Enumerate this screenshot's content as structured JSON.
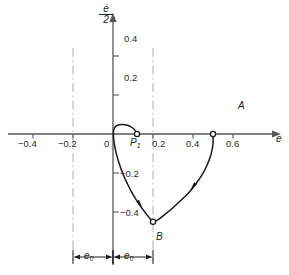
{
  "chart_data": {
    "type": "line",
    "title": "",
    "xlabel": "e",
    "ylabel": "ė/2",
    "ylabel_numerator": "ė",
    "ylabel_denominator": "2",
    "grid": false,
    "legend_position": "none",
    "xlim": [
      -0.52,
      0.72
    ],
    "ylim": [
      -0.55,
      0.52
    ],
    "xticks": [
      -0.4,
      -0.2,
      0,
      0.2,
      0.4,
      0.6
    ],
    "xtick_labels": [
      "−0.4",
      "−0.2",
      "0",
      "0.2",
      "0.4",
      "0.6"
    ],
    "yticks": [
      0.2,
      0.4,
      -0.2,
      -0.4
    ],
    "ytick_labels": [
      "0.2",
      "0.4",
      "−0.2",
      "−0.4"
    ],
    "reference_lines": [
      {
        "name": "switching-line-left",
        "x": -0.2,
        "style": "dash-dot"
      },
      {
        "name": "switching-line-right",
        "x": 0.2,
        "style": "dash-dot"
      }
    ],
    "points": [
      {
        "id": "A",
        "label": "A",
        "x": 0.5,
        "y": 0.0,
        "marker": "open-circle"
      },
      {
        "id": "B",
        "label": "B",
        "x": 0.2,
        "y": -0.45,
        "marker": "open-circle"
      },
      {
        "id": "P1",
        "label": "P",
        "label_sub": "1",
        "x": 0.12,
        "y": 0.0,
        "marker": "open-circle"
      }
    ],
    "series": [
      {
        "name": "trajectory-A-to-B",
        "direction": "A to B",
        "x": [
          0.5,
          0.5,
          0.49,
          0.47,
          0.445,
          0.415,
          0.38,
          0.34,
          0.3,
          0.26,
          0.228,
          0.206,
          0.2
        ],
        "y": [
          0.0,
          -0.05,
          -0.105,
          -0.16,
          -0.21,
          -0.255,
          -0.3,
          -0.34,
          -0.378,
          -0.412,
          -0.438,
          -0.45,
          -0.452
        ]
      },
      {
        "name": "trajectory-B-to-P1",
        "direction": "B to P1",
        "x": [
          0.2,
          0.178,
          0.155,
          0.132,
          0.11,
          0.09,
          0.072,
          0.055,
          0.04,
          0.027,
          0.016,
          0.008,
          0.003,
          0.002,
          0.006,
          0.016,
          0.03,
          0.048,
          0.068,
          0.088,
          0.105,
          0.115,
          0.12
        ],
        "y": [
          -0.452,
          -0.425,
          -0.395,
          -0.362,
          -0.328,
          -0.292,
          -0.255,
          -0.218,
          -0.178,
          -0.138,
          -0.098,
          -0.058,
          -0.022,
          0.008,
          0.028,
          0.04,
          0.047,
          0.049,
          0.046,
          0.038,
          0.026,
          0.012,
          0.0
        ]
      }
    ],
    "flow_arrows": [
      {
        "name": "arrow-right-branch",
        "x": 0.4,
        "y": -0.27,
        "angle_deg": 234
      },
      {
        "name": "arrow-left-branch",
        "x": 0.135,
        "y": -0.36,
        "angle_deg": 305
      }
    ],
    "dimensions": [
      {
        "name": "dim-left",
        "label": "e",
        "label_sub": "0",
        "from_x": -0.2,
        "to_x": 0.0,
        "y_px": 257
      },
      {
        "name": "dim-right",
        "label": "e",
        "label_sub": "0",
        "from_x": 0.0,
        "to_x": 0.2,
        "y_px": 257
      }
    ],
    "annotations": []
  },
  "colors": {
    "axis": "#555555",
    "curve": "#1a1a1a",
    "reference_line": "#b9b4ae",
    "text": "#1f1f1f"
  }
}
